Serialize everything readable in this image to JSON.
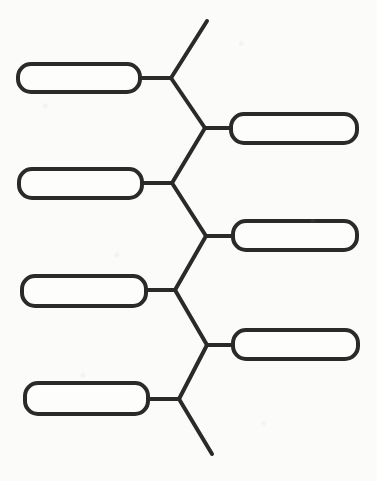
{
  "document": {
    "title": "Blank Bracket Tree Diagram",
    "kind": "worksheet-diagram",
    "background_color": "#fbfbf9",
    "ink_color": "#2a2a28",
    "stroke_width": 4,
    "canvas": {
      "width": 377,
      "height": 481
    }
  },
  "diagram": {
    "type": "bracket-tree",
    "boxes": [
      {
        "id": "box-left-1",
        "label": "",
        "side": "left",
        "row": 1,
        "x": 18,
        "y": 64,
        "width": 122,
        "height": 28,
        "radius": 13
      },
      {
        "id": "box-right-1",
        "label": "",
        "side": "right",
        "row": 1,
        "x": 231,
        "y": 114,
        "width": 126,
        "height": 29,
        "radius": 13
      },
      {
        "id": "box-left-2",
        "label": "",
        "side": "left",
        "row": 2,
        "x": 19,
        "y": 169,
        "width": 123,
        "height": 29,
        "radius": 13
      },
      {
        "id": "box-right-2",
        "label": "",
        "side": "right",
        "row": 2,
        "x": 233,
        "y": 221,
        "width": 124,
        "height": 29,
        "radius": 13
      },
      {
        "id": "box-left-3",
        "label": "",
        "side": "left",
        "row": 3,
        "x": 22,
        "y": 276,
        "width": 124,
        "height": 30,
        "radius": 13
      },
      {
        "id": "box-right-3",
        "label": "",
        "side": "right",
        "row": 3,
        "x": 233,
        "y": 330,
        "width": 125,
        "height": 29,
        "radius": 13
      },
      {
        "id": "box-left-4",
        "label": "",
        "side": "left",
        "row": 4,
        "x": 25,
        "y": 383,
        "width": 123,
        "height": 31,
        "radius": 13
      }
    ],
    "junctions": [
      {
        "id": "junction-1",
        "x": 171,
        "y": 78
      },
      {
        "id": "junction-2",
        "x": 205,
        "y": 128
      },
      {
        "id": "junction-3",
        "x": 172,
        "y": 183
      },
      {
        "id": "junction-4",
        "x": 206,
        "y": 236
      },
      {
        "id": "junction-5",
        "x": 175,
        "y": 290
      },
      {
        "id": "junction-6",
        "x": 207,
        "y": 345
      },
      {
        "id": "junction-7",
        "x": 179,
        "y": 399
      }
    ],
    "connectors": [
      {
        "id": "stub-top",
        "path": "M 171 78 L 207 21",
        "kind": "diagonal-open"
      },
      {
        "id": "link-left1-j1",
        "path": "M 140 78 L 171 78",
        "kind": "horizontal"
      },
      {
        "id": "link-j1-j2",
        "path": "M 171 78 L 205 128",
        "kind": "diagonal"
      },
      {
        "id": "link-j2-right1",
        "path": "M 205 128 L 231 128",
        "kind": "horizontal"
      },
      {
        "id": "link-j3-j2",
        "path": "M 172 183 L 205 128",
        "kind": "diagonal"
      },
      {
        "id": "link-left2-j3",
        "path": "M 142 183 L 172 183",
        "kind": "horizontal"
      },
      {
        "id": "link-j3-j4",
        "path": "M 172 183 L 206 236",
        "kind": "diagonal"
      },
      {
        "id": "link-j4-right2",
        "path": "M 206 236 L 233 236",
        "kind": "horizontal"
      },
      {
        "id": "link-j5-j4",
        "path": "M 175 290 L 206 236",
        "kind": "diagonal"
      },
      {
        "id": "link-left3-j5",
        "path": "M 146 290 L 175 290",
        "kind": "horizontal"
      },
      {
        "id": "link-j5-j6",
        "path": "M 175 290 L 207 345",
        "kind": "diagonal"
      },
      {
        "id": "link-j6-right3",
        "path": "M 207 345 L 233 345",
        "kind": "horizontal"
      },
      {
        "id": "link-j7-j6",
        "path": "M 179 399 L 207 345",
        "kind": "diagonal"
      },
      {
        "id": "link-left4-j7",
        "path": "M 148 399 L 179 399",
        "kind": "horizontal"
      },
      {
        "id": "stub-bottom",
        "path": "M 179 399 L 212 454",
        "kind": "diagonal-open"
      }
    ]
  }
}
